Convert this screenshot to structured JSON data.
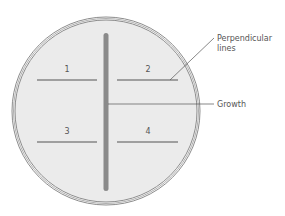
{
  "diagram": {
    "type": "petri-dish-streak",
    "colors": {
      "dish_fill": "#ebebeb",
      "dish_rim": "#8c8c8c",
      "growth": "#8a8a8a",
      "line": "#555555",
      "text": "#555555"
    },
    "growth_label": "Growth",
    "perpendicular_label_line1": "Perpendicular",
    "perpendicular_label_line2": "lines",
    "segments": [
      {
        "number": "1"
      },
      {
        "number": "2"
      },
      {
        "number": "3"
      },
      {
        "number": "4"
      }
    ]
  }
}
